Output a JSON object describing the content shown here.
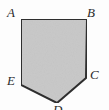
{
  "figure": {
    "name": "pentagon-ABCDE",
    "fill_color": "#c9c9c9",
    "stroke_color": "#2e2e2e",
    "stroke_width": 2,
    "background_color": "#fdfdfd",
    "label_color": "#2b2b2b",
    "canvas": {
      "width": 109,
      "height": 110
    },
    "vertices": [
      {
        "id": "A",
        "label": "A",
        "x": 21,
        "y": 19
      },
      {
        "id": "B",
        "label": "B",
        "x": 87,
        "y": 19
      },
      {
        "id": "C",
        "label": "C",
        "x": 86,
        "y": 78
      },
      {
        "id": "D",
        "label": "D",
        "x": 57,
        "y": 103
      },
      {
        "id": "E",
        "label": "E",
        "x": 21,
        "y": 85
      }
    ],
    "polygon_points": "21,19 87,19 86,78 57,103 21,85",
    "edges": [
      "AB",
      "BC",
      "CD",
      "DE",
      "EA"
    ]
  }
}
